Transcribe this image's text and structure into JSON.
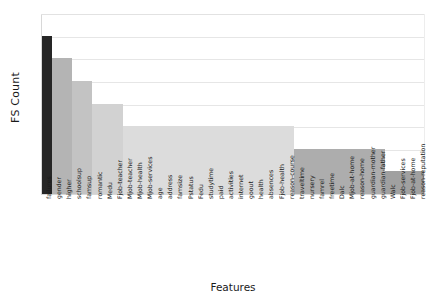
{
  "chart_data": {
    "type": "bar",
    "title": "",
    "xlabel": "Features",
    "ylabel": "FS Count",
    "ylim": [
      0,
      8
    ],
    "yticks": [
      0,
      1,
      2,
      3,
      4,
      5,
      6,
      7,
      8
    ],
    "grid": true,
    "legend": "none",
    "categories": [
      "failures",
      "gender",
      "higher",
      "schoolsup",
      "famsup",
      "romantic",
      "Medu",
      "Fjob-teacher",
      "Mjob-teacher",
      "Mjob-health",
      "Mjob-services",
      "age",
      "address",
      "famsize",
      "Pstatus",
      "Fedu",
      "studytime",
      "paid",
      "activities",
      "internet",
      "goout",
      "health",
      "absences",
      "Fjob-health",
      "reason-course",
      "traveltime",
      "nursery",
      "famrel",
      "freetime",
      "Dalc",
      "Mjob-at-home",
      "reason-home",
      "guardian-mother",
      "guardian-father",
      "Walc",
      "Fjob-services",
      "Fjob-at-home",
      "reason-reputation"
    ],
    "values": [
      7,
      6,
      6,
      5,
      5,
      4,
      4,
      4,
      3,
      3,
      3,
      3,
      3,
      3,
      3,
      3,
      3,
      3,
      3,
      3,
      3,
      3,
      3,
      3,
      3,
      2,
      2,
      2,
      2,
      2,
      2,
      2,
      2,
      2,
      1,
      1,
      1,
      1
    ],
    "bar_colors": [
      "#262626",
      "#b4b4b4",
      "#b4b4b4",
      "#c3c3c3",
      "#c3c3c3",
      "#d2d2d2",
      "#d2d2d2",
      "#d2d2d2",
      "#dcdcdc",
      "#dcdcdc",
      "#dcdcdc",
      "#dcdcdc",
      "#dcdcdc",
      "#dcdcdc",
      "#dcdcdc",
      "#dcdcdc",
      "#dcdcdc",
      "#dcdcdc",
      "#dcdcdc",
      "#dcdcdc",
      "#dcdcdc",
      "#dcdcdc",
      "#dcdcdc",
      "#dcdcdc",
      "#dcdcdc",
      "#adadad",
      "#adadad",
      "#adadad",
      "#adadad",
      "#adadad",
      "#adadad",
      "#adadad",
      "#adadad",
      "#adadad",
      "#a0a0a0",
      "#a0a0a0",
      "#a0a0a0",
      "#a0a0a0"
    ]
  },
  "axes": {
    "y_title": "FS Count",
    "x_title": "Features"
  }
}
